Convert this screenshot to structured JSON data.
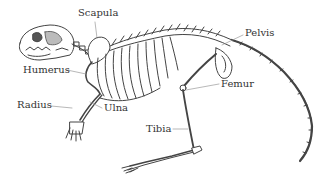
{
  "diagram": {
    "colors": {
      "bone_stroke": "#444444",
      "bone_fill": "#ffffff",
      "leader_line": "#999999",
      "label_text": "#333333",
      "background": "#ffffff"
    },
    "labels": [
      {
        "id": "scapula",
        "text": "Scapula",
        "x": 78,
        "y": 11
      },
      {
        "id": "pelvis",
        "text": "Pelvis",
        "x": 245,
        "y": 31
      },
      {
        "id": "humerus",
        "text": "Humerus",
        "x": 23,
        "y": 67
      },
      {
        "id": "femur",
        "text": "Femur",
        "x": 221,
        "y": 80
      },
      {
        "id": "radius",
        "text": "Radius",
        "x": 17,
        "y": 102
      },
      {
        "id": "ulna",
        "text": "Ulna",
        "x": 104,
        "y": 104
      },
      {
        "id": "tibia",
        "text": "Tibia",
        "x": 146,
        "y": 126
      }
    ]
  }
}
